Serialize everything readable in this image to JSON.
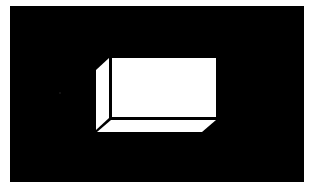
{
  "figure": {
    "background_color": "#000000",
    "page_color": "#ffffff",
    "box_color": "#ffffff",
    "edge_color": "#000000",
    "panel": {
      "x": 10,
      "y": 6,
      "width": 294,
      "height": 176
    },
    "faces": {
      "front": "112,58 216,58 216,117 112,117",
      "left": "96,70 109,58 109,118 96,130",
      "bottom": "97,132 111,120 216,120 202,132"
    },
    "speck": {
      "cx": 60,
      "cy": 93,
      "r": 0.8,
      "color": "#2a2a2a"
    }
  }
}
